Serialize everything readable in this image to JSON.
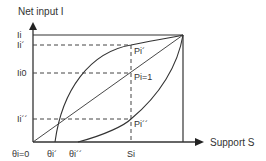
{
  "diagram": {
    "y_axis_title": "Net input I",
    "x_axis_title": "Support S",
    "y_labels": {
      "max": "Ii",
      "prime": "Ii´",
      "zero": "Ii0",
      "double_prime": "Ii´´"
    },
    "x_labels": {
      "origin": "θi=0",
      "prime": "θi´",
      "double_prime": "θi´´",
      "si": "Si"
    },
    "point_labels": {
      "p_prime": "Pi´",
      "p_one": "Pi=1",
      "p_double_prime": "Pi´´"
    },
    "curves": [
      {
        "name": "concave-curve",
        "description": "Rises steeply from θi´ to Ii at max support, passing Pi´"
      },
      {
        "name": "linear-curve",
        "description": "Straight line from origin to Ii at max support, passing Pi=1"
      },
      {
        "name": "convex-curve",
        "description": "Rises slowly from θi´´ to Ii at max support, passing Pi´´"
      }
    ]
  }
}
